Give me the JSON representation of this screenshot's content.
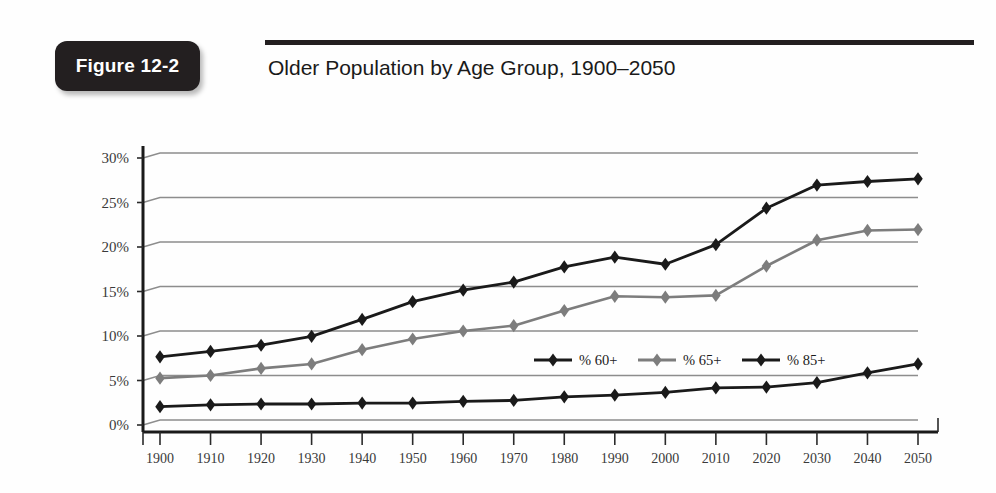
{
  "figure": {
    "badge_label": "Figure 12-2",
    "title": "Older Population by Age Group, 1900–2050"
  },
  "colors": {
    "badge_background": "#231f20",
    "badge_text": "#ffffff",
    "rule": "#231f20",
    "gridline": "#8d8d8d",
    "axis": "#1a1a1a",
    "series_60plus": "#1a1a1a",
    "series_65plus": "#7d7d7d",
    "series_85plus": "#1a1a1a",
    "page_background": "#fefefe"
  },
  "chart_data": {
    "type": "line",
    "title": "Older Population by Age Group, 1900–2050",
    "xlabel": "",
    "ylabel": "",
    "ylim": [
      0,
      30
    ],
    "ytick_labels": [
      "0%",
      "5%",
      "10%",
      "15%",
      "20%",
      "25%",
      "30%"
    ],
    "ytick_values": [
      0,
      5,
      10,
      15,
      20,
      25,
      30
    ],
    "grid": true,
    "grid_axis": "y",
    "legend_position": "center-right-inside",
    "x": [
      1900,
      1910,
      1920,
      1930,
      1940,
      1950,
      1960,
      1970,
      1980,
      1990,
      2000,
      2010,
      2020,
      2030,
      2040,
      2050
    ],
    "xtick_labels": [
      "1900",
      "1910",
      "1920",
      "1930",
      "1940",
      "1950",
      "1960",
      "1970",
      "1980",
      "1990",
      "2000",
      "2010",
      "2020",
      "2030",
      "2040",
      "2050"
    ],
    "series": [
      {
        "name": "% 60+",
        "color": "#1a1a1a",
        "marker": "diamond",
        "values": [
          7.1,
          7.7,
          8.4,
          9.4,
          11.3,
          13.3,
          14.6,
          15.5,
          17.2,
          18.3,
          17.5,
          19.7,
          23.8,
          26.4,
          26.8,
          27.1
        ]
      },
      {
        "name": "% 65+",
        "color": "#7d7d7d",
        "marker": "diamond",
        "values": [
          4.7,
          5.0,
          5.8,
          6.3,
          7.9,
          9.1,
          10.0,
          10.6,
          12.3,
          13.9,
          13.8,
          14.0,
          17.3,
          20.2,
          21.3,
          21.4
        ]
      },
      {
        "name": "% 85+",
        "color": "#1a1a1a",
        "marker": "diamond",
        "values": [
          1.5,
          1.7,
          1.8,
          1.8,
          1.9,
          1.9,
          2.1,
          2.2,
          2.6,
          2.8,
          3.1,
          3.6,
          3.7,
          4.2,
          5.3,
          6.3
        ]
      }
    ]
  }
}
